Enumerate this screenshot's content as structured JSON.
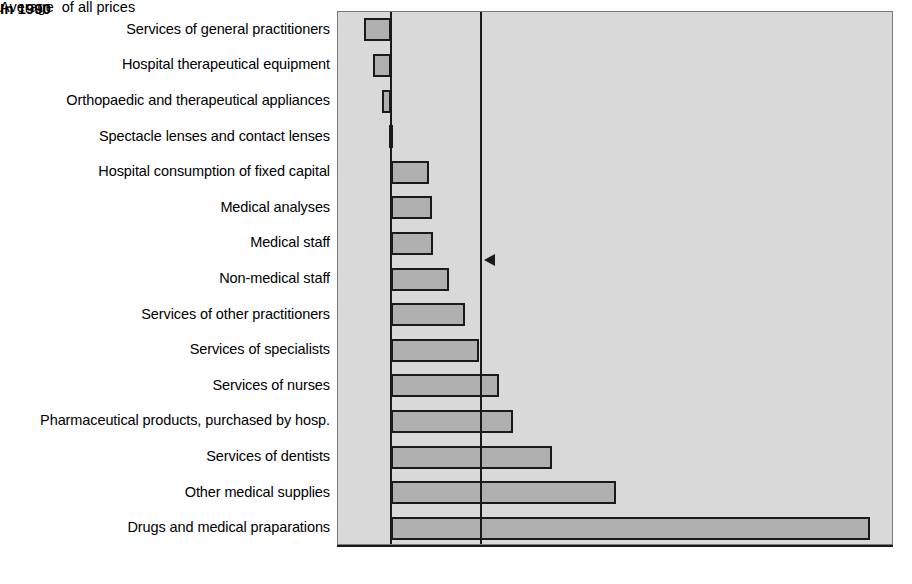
{
  "chart_data": {
    "type": "bar",
    "orientation": "horizontal",
    "title": "",
    "subtitle": "",
    "xlabel": "",
    "ylabel": "",
    "xlim": [
      -10,
      95
    ],
    "xticks": [
      -10,
      -5,
      0,
      5,
      10,
      15,
      20,
      25,
      30,
      35,
      40,
      45,
      50,
      55,
      60,
      65,
      70,
      75,
      80,
      85,
      90,
      95
    ],
    "xtick_labels": [
      "-10",
      "-5",
      "0",
      "5",
      "10",
      "15",
      "20",
      "25",
      "30",
      "35",
      "40",
      "45",
      "50",
      "55",
      "60",
      "65",
      "70",
      "75",
      "80",
      "85",
      "90",
      "95"
    ],
    "grid": false,
    "legend": null,
    "categories": [
      "Services of general practitioners",
      "Hospital therapeutical equipment",
      "Orthopaedic and therapeutical appliances",
      "Spectacle lenses and contact lenses",
      "Hospital consumption of fixed capital",
      "Medical  analyses",
      "Medical staff",
      "Non-medical staff",
      "Services of other practitioners",
      "Services of specialists",
      "Services of nurses",
      "Pharmaceutical products, purchased by hosp.",
      "Services of dentists",
      "Other medical supplies",
      "Drugs and medical praparations"
    ],
    "values": [
      -5.0,
      -3.3,
      -1.6,
      -0.4,
      7.2,
      7.8,
      8.0,
      11.0,
      14.0,
      16.6,
      20.5,
      23.0,
      30.5,
      42.5,
      90.5
    ],
    "annotations": [
      {
        "name": "average-of-all-prices",
        "text": "Average  of all prices",
        "value": 17.0,
        "marker": "vertical-line-with-left-arrow"
      },
      {
        "name": "year-badge",
        "text": "In 1990"
      }
    ],
    "colors": {
      "bar_fill": "#b0b0b0",
      "bar_stroke": "#1a1a1a",
      "plot_background": "#d9d9d9",
      "page_background": "#ffffff",
      "axis": "#1a1a1a",
      "text": "#000000"
    }
  },
  "annotation": {
    "average_label": "Average  of all prices"
  },
  "badge": {
    "year_label": "In 1990"
  }
}
